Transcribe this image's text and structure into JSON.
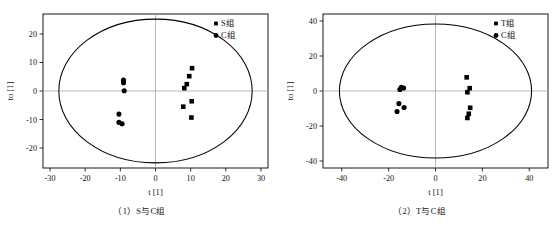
{
  "figure": {
    "panels": [
      {
        "id": "panel-1",
        "caption": "（1）S与C组",
        "xlabel": "t [1]",
        "ylabel": "to [1]",
        "legend": [
          {
            "label": "S组",
            "marker": "square"
          },
          {
            "label": "C组",
            "marker": "circle"
          }
        ]
      },
      {
        "id": "panel-2",
        "caption": "（2）T与C组",
        "xlabel": "t [1]",
        "ylabel": "to [1]",
        "legend": [
          {
            "label": "T组",
            "marker": "square"
          },
          {
            "label": "C组",
            "marker": "circle"
          }
        ]
      }
    ]
  },
  "chart_data": [
    {
      "type": "scatter",
      "title": "（1）S与C组",
      "xlabel": "t [1]",
      "ylabel": "to [1]",
      "xlim": [
        -32,
        32
      ],
      "ylim": [
        -27,
        27
      ],
      "xticks": [
        -30,
        -20,
        -10,
        0,
        10,
        20,
        30
      ],
      "yticks": [
        -20,
        -10,
        0,
        10,
        20
      ],
      "xticklabels": [
        "-30",
        "-20",
        "-10",
        "0",
        "10",
        "20",
        "30"
      ],
      "yticklabels": [
        "-20",
        "-10",
        "0",
        "10",
        "20"
      ],
      "grid": false,
      "zero_lines": true,
      "confidence_ellipse": {
        "cx": 0,
        "cy": 0,
        "rx": 27.5,
        "ry": 25.2
      },
      "legend_position": "top-right",
      "series": [
        {
          "name": "S组",
          "marker": "square",
          "color": "#000000",
          "points": [
            [
              10.4,
              8.0
            ],
            [
              9.6,
              5.2
            ],
            [
              8.9,
              2.4
            ],
            [
              8.2,
              1.0
            ],
            [
              10.3,
              -3.6
            ],
            [
              7.9,
              -5.5
            ],
            [
              10.2,
              -9.3
            ]
          ]
        },
        {
          "name": "C组",
          "marker": "circle",
          "color": "#000000",
          "points": [
            [
              -9.1,
              3.8
            ],
            [
              -9.1,
              2.9
            ],
            [
              -8.9,
              0.1
            ],
            [
              -10.4,
              -8.1
            ],
            [
              -10.4,
              -11.0
            ],
            [
              -9.5,
              -11.5
            ]
          ]
        }
      ]
    },
    {
      "type": "scatter",
      "title": "（2）T与C组",
      "xlabel": "t [1]",
      "ylabel": "to [1]",
      "xlim": [
        -48,
        48
      ],
      "ylim": [
        -44,
        44
      ],
      "xticks": [
        -40,
        -20,
        0,
        20,
        40
      ],
      "yticks": [
        -40,
        -20,
        0,
        20,
        40
      ],
      "xticklabels": [
        "-40",
        "-20",
        "0",
        "20",
        "40"
      ],
      "yticklabels": [
        "-40",
        "-20",
        "0",
        "20",
        "40"
      ],
      "grid": false,
      "zero_lines": true,
      "confidence_ellipse": {
        "cx": 0,
        "cy": 0,
        "rx": 41.0,
        "ry": 38.3
      },
      "legend_position": "top-right",
      "series": [
        {
          "name": "T组",
          "marker": "square",
          "color": "#000000",
          "points": [
            [
              13.3,
              7.8
            ],
            [
              14.6,
              1.6
            ],
            [
              13.6,
              -0.7
            ],
            [
              14.8,
              -9.6
            ],
            [
              14.2,
              -13.0
            ],
            [
              13.6,
              -15.4
            ]
          ]
        },
        {
          "name": "C组",
          "marker": "circle",
          "color": "#000000",
          "points": [
            [
              -14.6,
              2.1
            ],
            [
              -13.6,
              1.7
            ],
            [
              -15.2,
              0.9
            ],
            [
              -15.6,
              -7.2
            ],
            [
              -13.4,
              -9.4
            ],
            [
              -16.4,
              -11.7
            ]
          ]
        }
      ]
    }
  ]
}
